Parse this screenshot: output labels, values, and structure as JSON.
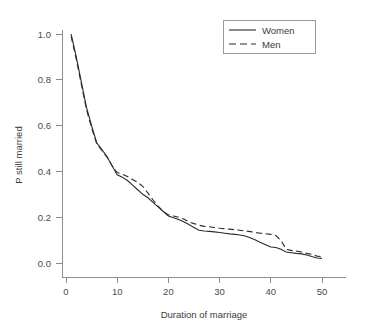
{
  "chart_data": {
    "type": "line",
    "title": "",
    "xlabel": "Duration of marriage",
    "ylabel": "P still married",
    "xlim": [
      0,
      52
    ],
    "ylim": [
      0.0,
      1.05
    ],
    "grid": false,
    "legend_position": "top-right",
    "xticks": [
      0,
      10,
      20,
      30,
      40,
      50
    ],
    "xtick_labels": [
      "0",
      "10",
      "20",
      "30",
      "40",
      "50"
    ],
    "yticks": [
      0.0,
      0.2,
      0.4,
      0.6,
      0.8,
      1.0
    ],
    "ytick_labels": [
      "0.0",
      "0.2",
      "0.4",
      "0.6",
      "0.8",
      "1.0"
    ],
    "x": [
      1,
      2,
      3,
      4,
      5,
      6,
      7,
      8,
      9,
      10,
      11,
      12,
      13,
      14,
      15,
      16,
      17,
      18,
      19,
      20,
      21,
      22,
      23,
      24,
      25,
      26,
      27,
      28,
      29,
      30,
      31,
      32,
      33,
      34,
      35,
      36,
      37,
      38,
      39,
      40,
      41,
      42,
      43,
      44,
      45,
      46,
      47,
      48,
      49,
      50
    ],
    "series": [
      {
        "name": "Women",
        "style": "solid",
        "color": "#2b2b2b",
        "values": [
          1.0,
          0.9,
          0.79,
          0.68,
          0.6,
          0.525,
          0.495,
          0.465,
          0.425,
          0.385,
          0.375,
          0.36,
          0.34,
          0.32,
          0.3,
          0.285,
          0.265,
          0.245,
          0.225,
          0.205,
          0.198,
          0.19,
          0.18,
          0.168,
          0.155,
          0.143,
          0.14,
          0.138,
          0.136,
          0.133,
          0.13,
          0.127,
          0.125,
          0.122,
          0.118,
          0.11,
          0.1,
          0.09,
          0.08,
          0.07,
          0.068,
          0.06,
          0.048,
          0.045,
          0.042,
          0.04,
          0.035,
          0.028,
          0.022,
          0.02
        ]
      },
      {
        "name": "Men",
        "style": "dashed",
        "color": "#2b2b2b",
        "values": [
          0.99,
          0.89,
          0.78,
          0.67,
          0.59,
          0.52,
          0.492,
          0.462,
          0.425,
          0.395,
          0.388,
          0.378,
          0.365,
          0.352,
          0.335,
          0.305,
          0.275,
          0.248,
          0.226,
          0.21,
          0.205,
          0.2,
          0.192,
          0.18,
          0.172,
          0.165,
          0.16,
          0.158,
          0.155,
          0.152,
          0.15,
          0.148,
          0.145,
          0.143,
          0.14,
          0.137,
          0.133,
          0.13,
          0.128,
          0.125,
          0.12,
          0.098,
          0.06,
          0.055,
          0.052,
          0.048,
          0.042,
          0.038,
          0.03,
          0.028
        ]
      }
    ],
    "legend": [
      {
        "label": "Women",
        "style": "solid"
      },
      {
        "label": "Men",
        "style": "dashed"
      }
    ]
  }
}
